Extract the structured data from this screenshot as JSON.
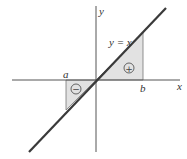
{
  "diagram": {
    "labels": {
      "y_axis": "y",
      "x_axis": "x",
      "line": "y = x",
      "a": "a",
      "b": "b",
      "positive_region": "+",
      "negative_region": "−"
    },
    "colors": {
      "axis": "#555555",
      "line": "#3a3a3a",
      "region_fill": "#e2e2e2",
      "region_edge": "#777777"
    }
  }
}
